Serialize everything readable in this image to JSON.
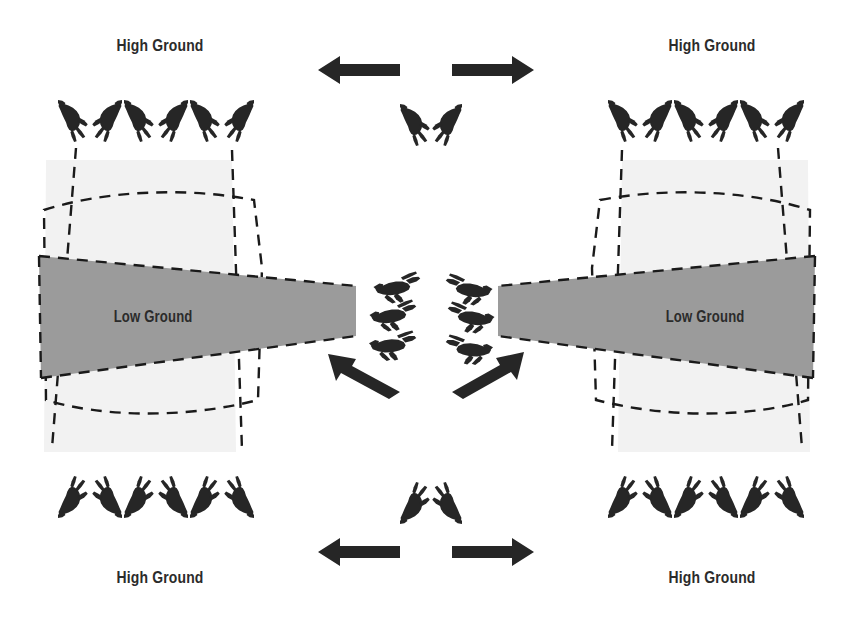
{
  "diagram": {
    "colors": {
      "background": "#ffffff",
      "low_ground_fill": "#9b9b9b",
      "high_ground_fill": "#f2f2f2",
      "dashed_line": "#1a1a1a",
      "figure": "#262626",
      "arrow": "#262626",
      "label_text": "#2b2b2b"
    },
    "labels": [
      {
        "id": "hg-tl",
        "text": "High Ground",
        "x": 160,
        "y": 46
      },
      {
        "id": "hg-tr",
        "text": "High Ground",
        "x": 712,
        "y": 46
      },
      {
        "id": "hg-bl",
        "text": "High Ground",
        "x": 160,
        "y": 578
      },
      {
        "id": "hg-br",
        "text": "High Ground",
        "x": 712,
        "y": 578
      },
      {
        "id": "lg-l",
        "text": "Low Ground",
        "x": 152,
        "y": 317
      },
      {
        "id": "lg-r",
        "text": "Low Ground",
        "x": 704,
        "y": 317
      }
    ],
    "arrows": [
      {
        "id": "arrow-top-left",
        "direction": "left",
        "x1": 400,
        "y1": 70,
        "x2": 322,
        "y2": 70
      },
      {
        "id": "arrow-top-right",
        "direction": "right",
        "x1": 452,
        "y1": 70,
        "x2": 532,
        "y2": 70
      },
      {
        "id": "arrow-mid-left",
        "direction": "up-left",
        "x1": 398,
        "y1": 393,
        "x2": 330,
        "y2": 356
      },
      {
        "id": "arrow-mid-right",
        "direction": "up-right",
        "x1": 452,
        "y1": 393,
        "x2": 524,
        "y2": 353
      },
      {
        "id": "arrow-bottom-left",
        "direction": "left",
        "x1": 400,
        "y1": 552,
        "x2": 322,
        "y2": 552
      },
      {
        "id": "arrow-bottom-right",
        "direction": "right",
        "x1": 452,
        "y1": 552,
        "x2": 532,
        "y2": 552
      }
    ],
    "figure_groups": [
      {
        "id": "top-left-line",
        "count": 6,
        "role": "support-by-fire",
        "position": "top-left"
      },
      {
        "id": "top-right-line",
        "count": 6,
        "role": "support-by-fire",
        "position": "top-right"
      },
      {
        "id": "bottom-left-line",
        "count": 6,
        "role": "support-by-fire",
        "position": "bottom-left"
      },
      {
        "id": "bottom-right-line",
        "count": 6,
        "role": "support-by-fire",
        "position": "bottom-right"
      },
      {
        "id": "center-top-pair",
        "count": 2,
        "role": "security",
        "position": "center-top"
      },
      {
        "id": "center-bottom-pair",
        "count": 2,
        "role": "security",
        "position": "center-bottom"
      },
      {
        "id": "center-left-stack",
        "count": 3,
        "role": "assault",
        "position": "center-left"
      },
      {
        "id": "center-right-stack",
        "count": 3,
        "role": "assault",
        "position": "center-right"
      }
    ]
  }
}
